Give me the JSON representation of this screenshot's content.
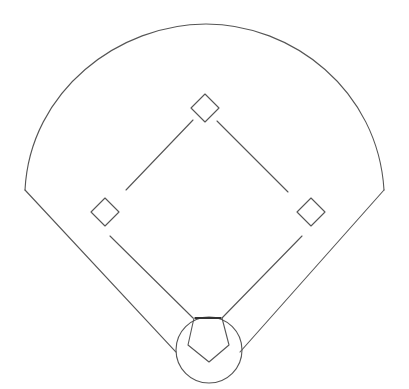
{
  "diagram": {
    "title": "Baseball field diagram",
    "type": "baseball-diamond",
    "stroke_color": "#555555",
    "background_color": "#ffffff",
    "elements": {
      "outfield_arc": {
        "label": "Outfield fence",
        "start": [
          25,
          190
        ],
        "apex": [
          206,
          24
        ],
        "end": [
          384,
          190
        ]
      },
      "left_foul_line": {
        "label": "Left field foul line",
        "from": [
          25,
          190
        ],
        "to": [
          176,
          352
        ]
      },
      "right_foul_line": {
        "label": "Right field foul line",
        "from": [
          384,
          190
        ],
        "to": [
          240,
          352
        ]
      },
      "home_circle": {
        "label": "Home plate circle",
        "center": [
          209,
          350
        ],
        "radius": 33
      },
      "home_plate": {
        "label": "Home plate",
        "points": [
          [
            194,
            318
          ],
          [
            222,
            318
          ],
          [
            229,
            345
          ],
          [
            209,
            362
          ],
          [
            188,
            345
          ]
        ]
      },
      "second_base": {
        "label": "Second base",
        "center": [
          205,
          108
        ],
        "half_size": 14
      },
      "third_base": {
        "label": "Third base",
        "center": [
          105,
          212
        ],
        "half_size": 14
      },
      "first_base": {
        "label": "First base",
        "center": [
          311,
          212
        ],
        "half_size": 14
      },
      "basepaths": [
        {
          "label": "Second to third basepath",
          "from": [
            193,
            120
          ],
          "to": [
            126,
            190
          ]
        },
        {
          "label": "Second to first basepath",
          "from": [
            218,
            122
          ],
          "to": [
            288,
            192
          ]
        },
        {
          "label": "Third to home basepath",
          "from": [
            110,
            236
          ],
          "to": [
            193,
            318
          ]
        },
        {
          "label": "First to home basepath",
          "from": [
            302,
            236
          ],
          "to": [
            222,
            318
          ]
        }
      ]
    }
  }
}
